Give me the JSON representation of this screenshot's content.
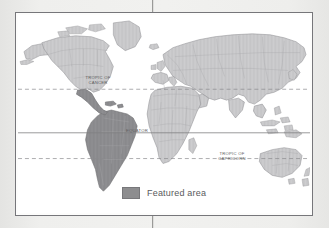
{
  "figure": {
    "kind": "world-map-figure",
    "background_color": "#ececeb",
    "panel_background": "#ffffff",
    "panel_border_color": "#76767a"
  },
  "map": {
    "projection_note": "world map, all continents",
    "land_fill": "#c9c9cb",
    "land_stroke": "#8b8b8e",
    "featured_fill": "#8d8d8f",
    "featured_stroke": "#6e6e71",
    "ocean_fill": "#ffffff",
    "featured_region": "South America"
  },
  "latitude_lines": [
    {
      "id": "tropic-of-cancer",
      "label": "TROPIC OF\nCANCER",
      "style": "dashed",
      "color": "#8a8a8d"
    },
    {
      "id": "equator",
      "label": "EQUATOR",
      "style": "solid",
      "color": "#7f7f82"
    },
    {
      "id": "tropic-of-capricorn",
      "label": "TROPIC OF\nCAPRICORN",
      "style": "dashed",
      "color": "#8a8a8d"
    }
  ],
  "legend": {
    "swatch_color": "#8d8d8f",
    "label": "Featured area"
  }
}
